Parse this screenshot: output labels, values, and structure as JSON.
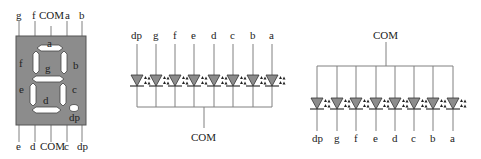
{
  "colors": {
    "wire": "#808080",
    "body": "#8c8c8c",
    "segment": "#ffffff",
    "led_fill": "#8c8c8c",
    "text": "#222222"
  },
  "seven_segment": {
    "top_pins": [
      "g",
      "f",
      "COM",
      "a",
      "b"
    ],
    "bottom_pins": [
      "e",
      "d",
      "COM",
      "c",
      "dp"
    ],
    "segments": {
      "a": "a",
      "b": "b",
      "c": "c",
      "d": "d",
      "e": "e",
      "f": "f",
      "g": "g",
      "dp": "dp"
    }
  },
  "common_cathode": {
    "pins": [
      "dp",
      "g",
      "f",
      "e",
      "d",
      "c",
      "b",
      "a"
    ],
    "common_label": "COM"
  },
  "common_anode": {
    "pins": [
      "dp",
      "g",
      "f",
      "e",
      "d",
      "c",
      "b",
      "a"
    ],
    "common_label": "COM"
  }
}
